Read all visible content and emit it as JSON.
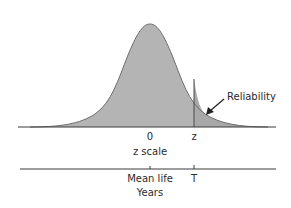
{
  "diagram": {
    "title": "",
    "curve": {
      "type": "normal-distribution",
      "fill_color": "#b4b4b4",
      "stroke_color": "#6e6e6e",
      "tail_shading_color": "#a9a9a9"
    },
    "z_axis": {
      "tick_zero_label": "0",
      "tick_z_label": "z",
      "axis_label": "z scale"
    },
    "time_axis": {
      "mean_label": "Mean life",
      "t_label": "T",
      "axis_label": "Years"
    },
    "annotation": {
      "label": "Reliability",
      "arrow": "arrow pointing to shaded right tail area beyond z"
    },
    "colors": {
      "axis": "#3a3a3a",
      "text": "#2b2b2b"
    }
  }
}
